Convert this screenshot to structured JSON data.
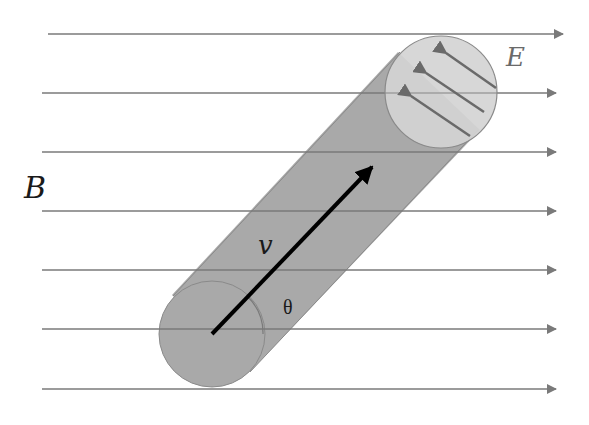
{
  "diagram": {
    "labels": {
      "magnetic_field": "B",
      "electric_field": "E",
      "velocity": "v",
      "angle": "θ"
    },
    "field_lines": {
      "count": 7,
      "y_positions": [
        34,
        93,
        152,
        211,
        270,
        329,
        389
      ],
      "direction": "right",
      "color": "#7a7a7a"
    },
    "cylinder": {
      "body_color": "#a9a9a9",
      "cap_color": "#d4d4d4",
      "edge_color": "#8a8a8a",
      "axis_angle_deg": 47
    },
    "velocity_arrow": {
      "color": "#000000"
    },
    "e_field_arrows": {
      "count": 3,
      "direction": "up-left",
      "color": "#6a6a6a"
    }
  }
}
